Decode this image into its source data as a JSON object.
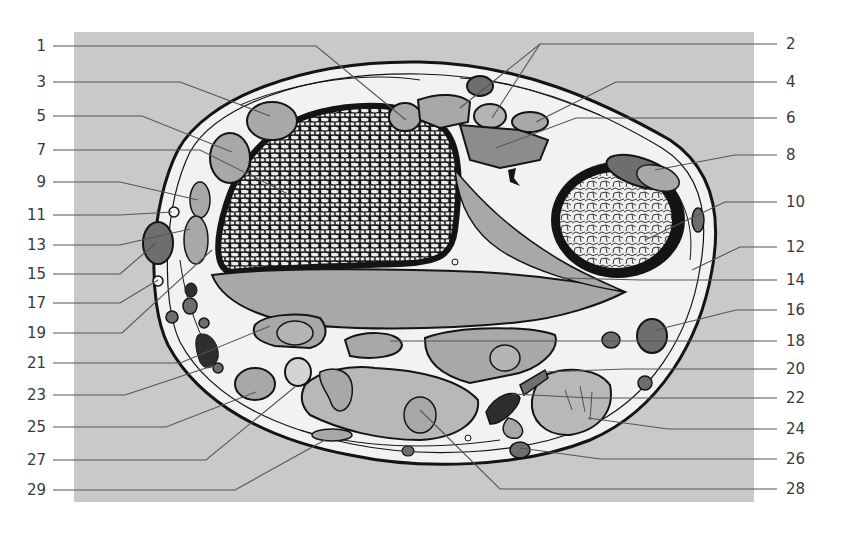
{
  "figure": {
    "panel_color": "#c9c9c9",
    "colors": {
      "outline": "#141414",
      "skin": "#f2f2f2",
      "muscle_light": "#a8a8a8",
      "muscle_mid": "#8c8c8c",
      "muscle_dark": "#6e6e6e",
      "vessel_dark": "#2e2e2e",
      "bone_cell_fill": "#ececec",
      "leader": "#555555"
    }
  },
  "labels_left": [
    {
      "num": "1",
      "y": 46,
      "tx": 406,
      "ty": 120
    },
    {
      "num": "3",
      "y": 82,
      "tx": 270,
      "ty": 116
    },
    {
      "num": "5",
      "y": 116,
      "tx": 232,
      "ty": 152
    },
    {
      "num": "7",
      "y": 150,
      "tx": 290,
      "ty": 195
    },
    {
      "num": "9",
      "y": 182,
      "tx": 198,
      "ty": 200
    },
    {
      "num": "11",
      "y": 215,
      "tx": 172,
      "ty": 212
    },
    {
      "num": "13",
      "y": 245,
      "tx": 190,
      "ty": 229
    },
    {
      "num": "15",
      "y": 274,
      "tx": 156,
      "ty": 243
    },
    {
      "num": "17",
      "y": 303,
      "tx": 158,
      "ty": 280
    },
    {
      "num": "19",
      "y": 333,
      "tx": 212,
      "ty": 250
    },
    {
      "num": "21",
      "y": 363,
      "tx": 270,
      "ty": 326
    },
    {
      "num": "23",
      "y": 395,
      "tx": 215,
      "ty": 365
    },
    {
      "num": "25",
      "y": 427,
      "tx": 256,
      "ty": 392
    },
    {
      "num": "27",
      "y": 460,
      "tx": 296,
      "ty": 386
    },
    {
      "num": "29",
      "y": 490,
      "tx": 325,
      "ty": 440
    }
  ],
  "labels_right": [
    {
      "num": "2",
      "y": 44,
      "tx": 460,
      "ty": 108,
      "tx2": 492,
      "ty2": 118
    },
    {
      "num": "4",
      "y": 82,
      "tx": 536,
      "ty": 122
    },
    {
      "num": "6",
      "y": 118,
      "tx": 496,
      "ty": 148
    },
    {
      "num": "8",
      "y": 155,
      "tx": 655,
      "ty": 170
    },
    {
      "num": "10",
      "y": 202,
      "tx": 645,
      "ty": 240
    },
    {
      "num": "12",
      "y": 247,
      "tx": 692,
      "ty": 270
    },
    {
      "num": "14",
      "y": 280,
      "tx": 562,
      "ty": 278
    },
    {
      "num": "16",
      "y": 310,
      "tx": 656,
      "ty": 330
    },
    {
      "num": "18",
      "y": 341,
      "tx": 390,
      "ty": 341
    },
    {
      "num": "20",
      "y": 369,
      "tx": 545,
      "ty": 372
    },
    {
      "num": "22",
      "y": 398,
      "tx": 512,
      "ty": 394
    },
    {
      "num": "24",
      "y": 429,
      "tx": 588,
      "ty": 418
    },
    {
      "num": "26",
      "y": 459,
      "tx": 520,
      "ty": 448
    },
    {
      "num": "28",
      "y": 489,
      "tx": 420,
      "ty": 410
    }
  ]
}
